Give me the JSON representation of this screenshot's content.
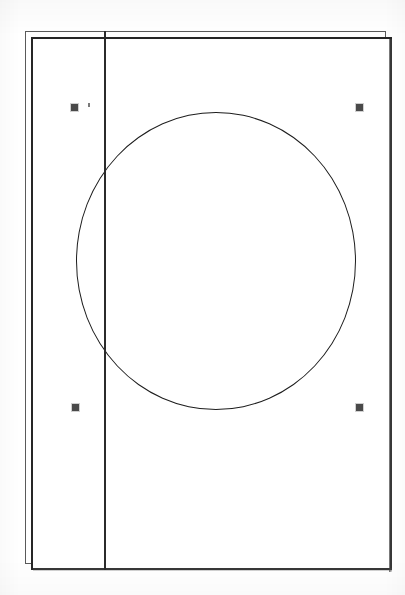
{
  "figure": {
    "title": "Technical line drawing",
    "background_color": "#ffffff",
    "ink_color": "#1d1d1d"
  },
  "frame": {
    "outer_label": "outer-offset-rectangle",
    "inner_label": "inner-sheet-rectangle",
    "outer_color": "#5a5a5a",
    "inner_color": "#262626",
    "outer": {
      "x": 25,
      "y": 31,
      "width": 361,
      "height": 533
    },
    "inner": {
      "x": 31,
      "y": 37,
      "width": 361,
      "height": 533
    }
  },
  "divider": {
    "label": "vertical-divider-line",
    "color": "#2b2b2b",
    "x": 104,
    "y_start": 31,
    "y_end": 570,
    "thickness": 2
  },
  "circle": {
    "label": "large-circle",
    "color": "#1d1d1d",
    "center_x": 216,
    "center_y": 261,
    "radius_x": 140,
    "radius_y": 149,
    "stroke_width": 1.6
  },
  "registration_marks": [
    {
      "label": "registration-mark-top-left",
      "x": 71,
      "y": 104,
      "size": 7,
      "color": "#4a4a4a"
    },
    {
      "label": "registration-mark-top-right",
      "x": 356,
      "y": 104,
      "size": 7,
      "color": "#4a4a4a"
    },
    {
      "label": "registration-mark-bottom-left",
      "x": 72,
      "y": 404,
      "size": 7,
      "color": "#4a4a4a"
    },
    {
      "label": "registration-mark-bottom-right",
      "x": 356,
      "y": 404,
      "size": 7,
      "color": "#4a4a4a"
    }
  ],
  "artifacts": {
    "speck_label": "scan-speck",
    "speck_color": "#7a7a7a"
  },
  "chart_data": {
    "type": "diagram",
    "title": "Technical line drawing",
    "shapes": [
      {
        "shape": "rectangle",
        "name": "outer-offset-rectangle",
        "x": 25,
        "y": 31,
        "width": 361,
        "height": 533,
        "stroke": "#5a5a5a",
        "fill": "none"
      },
      {
        "shape": "rectangle",
        "name": "inner-sheet-rectangle",
        "x": 31,
        "y": 37,
        "width": 361,
        "height": 533,
        "stroke": "#262626",
        "fill": "#ffffff"
      },
      {
        "shape": "line",
        "name": "vertical-divider-line",
        "x1": 104,
        "y1": 31,
        "x2": 104,
        "y2": 570,
        "stroke": "#2b2b2b"
      },
      {
        "shape": "ellipse",
        "name": "large-circle",
        "cx": 216,
        "cy": 261,
        "rx": 140,
        "ry": 149,
        "stroke": "#1d1d1d",
        "fill": "none"
      },
      {
        "shape": "square",
        "name": "registration-mark-top-left",
        "x": 71,
        "y": 104,
        "size": 7,
        "fill": "#4a4a4a"
      },
      {
        "shape": "square",
        "name": "registration-mark-top-right",
        "x": 356,
        "y": 104,
        "size": 7,
        "fill": "#4a4a4a"
      },
      {
        "shape": "square",
        "name": "registration-mark-bottom-left",
        "x": 72,
        "y": 404,
        "size": 7,
        "fill": "#4a4a4a"
      },
      {
        "shape": "square",
        "name": "registration-mark-bottom-right",
        "x": 356,
        "y": 404,
        "size": 7,
        "fill": "#4a4a4a"
      }
    ],
    "canvas": {
      "width": 405,
      "height": 595
    }
  }
}
